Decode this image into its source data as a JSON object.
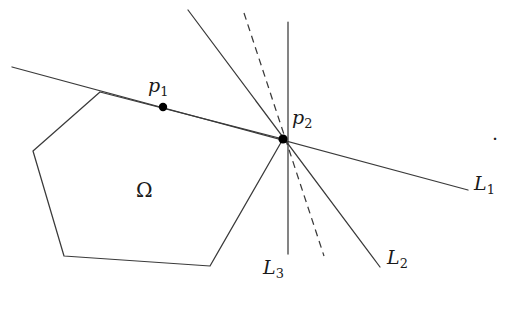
{
  "figure": {
    "width": 513,
    "height": 332,
    "background_color": "#ffffff",
    "stroke_color": "#3a3a3a",
    "point_color": "#000000"
  },
  "labels": {
    "point_p1": "p",
    "point_p1_sub": "1",
    "point_p2": "p",
    "point_p2_sub": "2",
    "region_omega": "Ω",
    "line_L1": "L",
    "line_L1_sub": "1",
    "line_L2": "L",
    "line_L2_sub": "2",
    "line_L3": "L",
    "line_L3_sub": "3",
    "trailing_period": "."
  },
  "geometry": {
    "intersection_point_p2": {
      "x": 283,
      "y": 139
    },
    "point_p1": {
      "x": 163,
      "y": 107
    },
    "polygon_omega": {
      "name": "omega-polygon",
      "points": "100,92 33,151 64,256 210,266 283,139",
      "vertices": [
        {
          "x": 100,
          "y": 92
        },
        {
          "x": 33,
          "y": 151
        },
        {
          "x": 64,
          "y": 256
        },
        {
          "x": 210,
          "y": 266
        },
        {
          "x": 283,
          "y": 139
        }
      ],
      "fill": "none"
    },
    "line_L1": {
      "name": "line-L1",
      "style": "solid",
      "x1": 12,
      "y1": 67,
      "x2": 468,
      "y2": 190
    },
    "line_L2": {
      "name": "line-L2",
      "style": "solid",
      "x1": 188,
      "y1": 10,
      "x2": 380,
      "y2": 267
    },
    "line_L3": {
      "name": "line-L3",
      "style": "solid",
      "x1": 288,
      "y1": 22,
      "x2": 288,
      "y2": 254
    },
    "line_dashed": {
      "name": "dashed-supporting-line",
      "style": "dashed",
      "dash_pattern": "7 5",
      "x1": 244,
      "y1": 13,
      "x2": 324,
      "y2": 256
    },
    "dot_radius": 4.2,
    "small_dot_radius": 3.4
  },
  "label_positions": {
    "p1": {
      "left": 148,
      "top": 76
    },
    "p2": {
      "left": 292,
      "top": 108
    },
    "omega": {
      "left": 136,
      "top": 180
    },
    "L1": {
      "left": 474,
      "top": 174
    },
    "L2": {
      "left": 387,
      "top": 248
    },
    "L3": {
      "left": 263,
      "top": 258
    },
    "period": {
      "left": 492,
      "top": 124
    }
  }
}
